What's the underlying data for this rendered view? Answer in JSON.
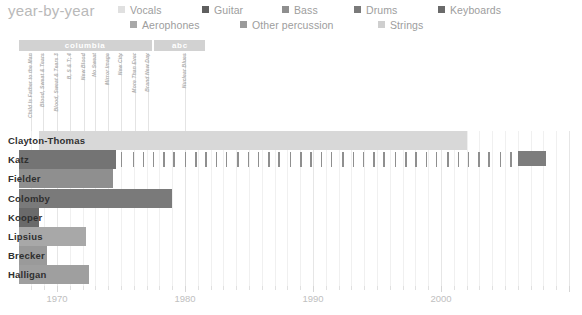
{
  "title": "year-by-year",
  "legend": {
    "rows": [
      [
        {
          "label": "Vocals",
          "color": "#e0e0e0"
        },
        {
          "label": "Guitar",
          "color": "#5f5f5f"
        },
        {
          "label": "Bass",
          "color": "#8f8f8f"
        },
        {
          "label": "Drums",
          "color": "#7a7a7a"
        },
        {
          "label": "Keyboards",
          "color": "#6a6a6a"
        }
      ],
      [
        {
          "label": "Aerophones",
          "color": "#a8a8a8"
        },
        {
          "label": "Other percussion",
          "color": "#9a9a9a"
        },
        {
          "label": "Strings",
          "color": "#cfcfcf"
        }
      ]
    ]
  },
  "record_labels": [
    {
      "name": "columbia",
      "start": 1967.0,
      "end": 1977.4
    },
    {
      "name": "abc",
      "start": 1977.6,
      "end": 1981.6
    }
  ],
  "albums": [
    {
      "name": "Child Is Father to the Man",
      "year": 1968.0
    },
    {
      "name": "Blood, Sweat & Tears",
      "year": 1968.9
    },
    {
      "name": "Blood, Sweat & Tears 3",
      "year": 1970.0
    },
    {
      "name": "B, S & T; 4",
      "year": 1971.0
    },
    {
      "name": "New Blood",
      "year": 1972.1
    },
    {
      "name": "No Sweat",
      "year": 1973.0
    },
    {
      "name": "Mirror Image",
      "year": 1974.0
    },
    {
      "name": "New City",
      "year": 1975.0
    },
    {
      "name": "More Than Ever",
      "year": 1976.1
    },
    {
      "name": "Brand New Day",
      "year": 1977.1
    },
    {
      "name": "Nuclear Blues",
      "year": 1980.0
    }
  ],
  "chart_data": {
    "type": "bar",
    "title": "year-by-year",
    "xlabel": "",
    "ylabel": "",
    "xlim": [
      1967,
      2010
    ],
    "xticks": [
      1970,
      1980,
      1990,
      2000
    ],
    "xtick_labels": [
      "1970",
      "1980",
      "1990",
      "2000"
    ],
    "xtick_minor_step": 1,
    "grid": true,
    "legend_position": "top-right",
    "categories": [
      "Clayton-Thomas",
      "Katz",
      "Fielder",
      "Colomby",
      "Kooper",
      "Lipsius",
      "Brecker",
      "Halligan"
    ],
    "bars": [
      {
        "name": "Clayton-Thomas",
        "start": 1968.6,
        "end": 2002.0,
        "color": "#d8d8d8",
        "instrument": "Vocals"
      },
      {
        "name": "Katz",
        "start": 1967.0,
        "end": 1974.6,
        "color": "#747474",
        "instrument": "Guitar"
      },
      {
        "name": "Fielder",
        "start": 1967.0,
        "end": 1974.4,
        "color": "#8f8f8f",
        "instrument": "Bass"
      },
      {
        "name": "Colomby",
        "start": 1967.0,
        "end": 1979.0,
        "color": "#7a7a7a",
        "instrument": "Drums"
      },
      {
        "name": "Kooper",
        "start": 1967.0,
        "end": 1968.6,
        "color": "#6a6a6a",
        "instrument": "Keyboards"
      },
      {
        "name": "Lipsius",
        "start": 1967.0,
        "end": 1972.3,
        "color": "#a8a8a8",
        "instrument": "Aerophones"
      },
      {
        "name": "Brecker",
        "start": 1967.0,
        "end": 1969.2,
        "color": "#9a9a9a",
        "instrument": "Other percussion"
      },
      {
        "name": "Halligan",
        "start": 1967.0,
        "end": 1972.5,
        "color": "#9f9f9f",
        "instrument": "Strings"
      }
    ],
    "katz_ticks": [
      1975.0,
      1975.9,
      1976.7,
      1977.5,
      1978.3,
      1979.1,
      1980.0,
      1980.8,
      1981.6,
      1982.4,
      1983.2,
      1984.1,
      1984.9,
      1985.7,
      1986.5,
      1987.3,
      1988.2,
      1989.0,
      1989.8,
      1990.6,
      1991.4,
      1992.3,
      1993.1,
      1993.9,
      1994.7,
      1995.5,
      1996.4,
      1997.2,
      1998.0,
      1998.8,
      1999.6,
      2000.5,
      2001.3,
      2002.1,
      2002.9,
      2003.7,
      2004.6,
      2005.4
    ],
    "katz_solo_block": {
      "start": 2006.0,
      "end": 2008.2
    }
  }
}
